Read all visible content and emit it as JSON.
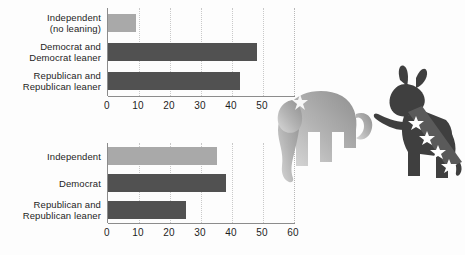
{
  "chart_data": [
    {
      "type": "bar",
      "orientation": "horizontal",
      "title": "",
      "xlabel": "",
      "ylabel": "",
      "xlim": [
        0,
        60
      ],
      "ticks": [
        0,
        10,
        20,
        30,
        40,
        50,
        60
      ],
      "grid": true,
      "legend": "none",
      "categories": [
        "Independent\n(no leaning)",
        "Democrat and\nDemocrat leaner",
        "Republican and\nRepublican leaner"
      ],
      "values": [
        9,
        48,
        42.5
      ],
      "bar_colors": [
        "#a9a9a9",
        "#515151",
        "#515151"
      ]
    },
    {
      "type": "bar",
      "orientation": "horizontal",
      "title": "",
      "xlabel": "",
      "ylabel": "",
      "xlim": [
        0,
        60
      ],
      "ticks": [
        0,
        10,
        20,
        30,
        40,
        50,
        60
      ],
      "grid": true,
      "legend": "none",
      "categories": [
        "Independent",
        "Democrat",
        "Republican and\nRepublican leaner"
      ],
      "values": [
        35,
        38,
        25
      ],
      "bar_colors": [
        "#a9a9a9",
        "#515151",
        "#515151"
      ]
    }
  ],
  "charts": [
    {
      "id": "chart-top",
      "ticks": [
        "0",
        "10",
        "20",
        "30",
        "40",
        "50",
        "60"
      ],
      "bars": [
        {
          "label_line1": "Independent",
          "label_line2": "(no leaning)",
          "value": 9,
          "color": "light"
        },
        {
          "label_line1": "Democrat and",
          "label_line2": "Democrat leaner",
          "value": 48,
          "color": "dark"
        },
        {
          "label_line1": "Republican and",
          "label_line2": "Republican leaner",
          "value": 42.5,
          "color": "dark"
        }
      ]
    },
    {
      "id": "chart-bottom",
      "ticks": [
        "0",
        "10",
        "20",
        "30",
        "40",
        "50",
        "60"
      ],
      "bars": [
        {
          "label_line1": "Independent",
          "label_line2": "",
          "value": 35,
          "color": "light"
        },
        {
          "label_line1": "Democrat",
          "label_line2": "",
          "value": 38,
          "color": "dark"
        },
        {
          "label_line1": "Republican and",
          "label_line2": "Republican leaner",
          "value": 25,
          "color": "dark"
        }
      ]
    }
  ],
  "mascots": {
    "elephant": {
      "name": "republican-elephant",
      "color": "#9a9a9a"
    },
    "donkey": {
      "name": "democratic-donkey",
      "color": "#3f3f3f",
      "stars": 4
    }
  },
  "colors": {
    "bar_light": "#a9a9a9",
    "bar_dark": "#515151",
    "axis": "#8c8c8c",
    "grid": "#c9c9c9",
    "text": "#1d1d1d",
    "background": "#fdfdfd"
  }
}
